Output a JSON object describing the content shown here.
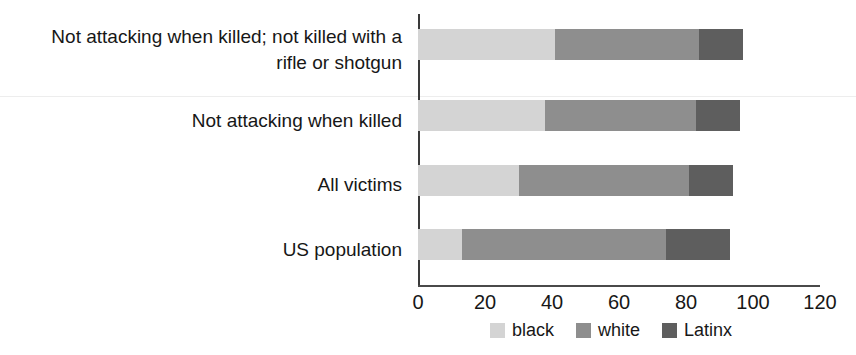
{
  "chart_data": {
    "type": "bar",
    "orientation": "horizontal",
    "stacked": true,
    "title": "",
    "subtitle": "",
    "xlabel": "",
    "ylabel": "",
    "xlim": [
      0,
      120
    ],
    "xticks": [
      0,
      20,
      40,
      60,
      80,
      100,
      120
    ],
    "xtick_labels": [
      "0",
      "20",
      "40",
      "60",
      "80",
      "100",
      "120"
    ],
    "grid": false,
    "legend_position": "bottom",
    "categories": [
      "Not attacking when killed; not killed with a\nrifle or shotgun",
      "Not attacking when killed",
      "All victims",
      "US population"
    ],
    "category_lines": [
      [
        "Not attacking when killed; not killed with a",
        "rifle or shotgun"
      ],
      [
        "Not attacking when killed"
      ],
      [
        "All victims"
      ],
      [
        "US population"
      ]
    ],
    "series": [
      {
        "name": "black",
        "color": "#d4d4d4",
        "values": [
          41,
          38,
          30,
          13
        ]
      },
      {
        "name": "white",
        "color": "#8e8e8e",
        "values": [
          43,
          45,
          51,
          61
        ]
      },
      {
        "name": "Latinx",
        "color": "#5e5e5e",
        "values": [
          13,
          13,
          13,
          19
        ]
      }
    ],
    "stack_totals": [
      97,
      96,
      94,
      93
    ],
    "legend": [
      {
        "label": "black",
        "color": "#d4d4d4"
      },
      {
        "label": "white",
        "color": "#8e8e8e"
      },
      {
        "label": "Latinx",
        "color": "#5e5e5e"
      }
    ],
    "axis_color": "#3a3a3a",
    "background": "#ffffff"
  }
}
